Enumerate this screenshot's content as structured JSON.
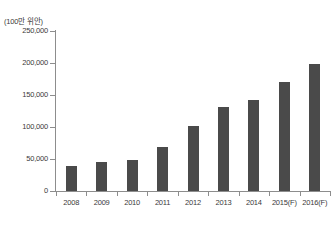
{
  "chart_data": {
    "type": "bar",
    "title": "",
    "subtitle": "",
    "unit_label": "(100만 위안)",
    "xlabel": "",
    "ylabel": "",
    "ylim": [
      0,
      250000
    ],
    "grid": false,
    "legend": "none",
    "categories": [
      "2008",
      "2009",
      "2010",
      "2011",
      "2012",
      "2013",
      "2014",
      "2015(F)",
      "2016(F)"
    ],
    "values": [
      39000,
      46000,
      49000,
      69000,
      101000,
      132000,
      142000,
      170000,
      199000
    ],
    "ytick_labels": [
      "0",
      "50,000",
      "100,000",
      "150,000",
      "200,000",
      "250,000"
    ],
    "ytick_values": [
      0,
      50000,
      100000,
      150000,
      200000,
      250000
    ],
    "series": [
      {
        "name": "value",
        "values": [
          39000,
          46000,
          49000,
          69000,
          101000,
          132000,
          142000,
          170000,
          199000
        ]
      }
    ],
    "bar_color": "#4a4a4a",
    "axis_color": "#8d8d8d",
    "background_color": "#ffffff"
  }
}
